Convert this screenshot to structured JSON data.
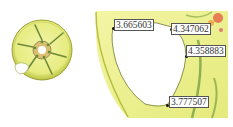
{
  "figure": {
    "left_panel": {
      "name": "wheel-overview",
      "colors": {
        "body": "#e9ee8a",
        "rim_edge": "#b9c23e",
        "spoke": "#6d8a3a",
        "hub": "#c8a060"
      }
    },
    "right_panel": {
      "name": "spoke-window-detail",
      "colors": {
        "body": "#eef08e",
        "shade": "#c6cf4d",
        "hot": "#e86a4a",
        "cool": "#6aa0a8"
      }
    },
    "annotations": [
      {
        "value": "3.665603"
      },
      {
        "value": "4.347062"
      },
      {
        "value": "4.358883"
      },
      {
        "value": "3.777507"
      }
    ]
  }
}
